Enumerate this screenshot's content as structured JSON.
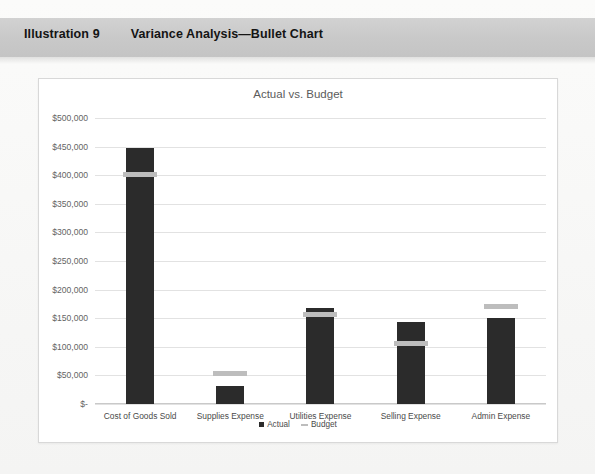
{
  "caption": {
    "number": "Illustration 9",
    "title": "Variance Analysis—Bullet Chart"
  },
  "chart_data": {
    "type": "bar",
    "title": "Actual vs. Budget",
    "xlabel": "",
    "ylabel": "",
    "ylim": [
      0,
      500000
    ],
    "grid": true,
    "legend_position": "bottom",
    "categories": [
      "Cost of Goods Sold",
      "Supplies Expense",
      "Utilities Expense",
      "Selling Expense",
      "Admin Expense"
    ],
    "ytick_labels": [
      "$-",
      "$50,000",
      "$100,000",
      "$150,000",
      "$200,000",
      "$250,000",
      "$300,000",
      "$350,000",
      "$400,000",
      "$450,000",
      "$500,000"
    ],
    "ytick_values": [
      0,
      50000,
      100000,
      150000,
      200000,
      250000,
      300000,
      350000,
      400000,
      450000,
      500000
    ],
    "series": [
      {
        "name": "Actual",
        "type": "bar",
        "color": "#2b2b2b",
        "values": [
          447500,
          31500,
          168000,
          143000,
          150000
        ]
      },
      {
        "name": "Budget",
        "type": "marker",
        "color": "#bdbdbd",
        "values": [
          402000,
          54000,
          157000,
          105000,
          171000
        ]
      }
    ]
  },
  "legend": [
    {
      "label": "Actual",
      "marker": "square",
      "color": "#2b2b2b"
    },
    {
      "label": "Budget",
      "marker": "dash",
      "color": "#bdbdbd"
    }
  ]
}
